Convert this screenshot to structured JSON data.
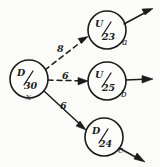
{
  "diagram": {
    "background_color": "#fbfbfa",
    "ink_color": "#1b1b1b",
    "nodes": [
      {
        "id": "source",
        "numerator": "D",
        "denominator": "30",
        "tag": "x",
        "cx": 29,
        "cy": 79,
        "r": 19
      },
      {
        "id": "node-a",
        "numerator": "U",
        "denominator": "23",
        "tag": "a",
        "cx": 107,
        "cy": 30,
        "r": 19
      },
      {
        "id": "node-b",
        "numerator": "U",
        "denominator": "25",
        "tag": "b",
        "cx": 107,
        "cy": 81,
        "r": 19
      },
      {
        "id": "node-c",
        "numerator": "D",
        "denominator": "24",
        "tag": "c",
        "cx": 104,
        "cy": 137,
        "r": 19
      }
    ],
    "edges": [
      {
        "id": "edge-source-a",
        "from": "source",
        "to": "node-a",
        "label": "8",
        "style": "dashed"
      },
      {
        "id": "edge-source-b",
        "from": "source",
        "to": "node-b",
        "label": "6",
        "style": "dashed"
      },
      {
        "id": "edge-source-c",
        "from": "source",
        "to": "node-c",
        "label": "6",
        "style": "solid"
      }
    ],
    "outgoing_arrows": [
      {
        "id": "out-a",
        "from": "node-a",
        "direction": "up-right"
      },
      {
        "id": "out-b",
        "from": "node-b",
        "direction": "right"
      },
      {
        "id": "out-c",
        "from": "node-c",
        "direction": "down-right"
      }
    ]
  }
}
